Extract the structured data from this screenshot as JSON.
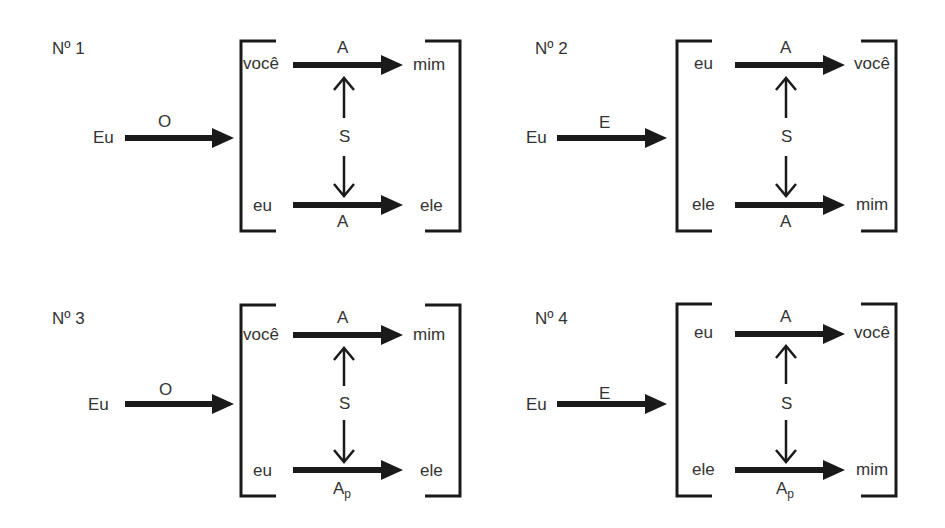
{
  "diagram": {
    "panels": [
      {
        "number": "Nº 1",
        "subject": "Eu",
        "input_label": "O",
        "top": {
          "left": "você",
          "label": "A",
          "label_sub": "",
          "right": "mim"
        },
        "middle": "S",
        "bottom": {
          "left": "eu",
          "label": "A",
          "label_sub": "",
          "right": "ele"
        }
      },
      {
        "number": "Nº 2",
        "subject": "Eu",
        "input_label": "E",
        "top": {
          "left": "eu",
          "label": "A",
          "label_sub": "",
          "right": "você"
        },
        "middle": "S",
        "bottom": {
          "left": "ele",
          "label": "A",
          "label_sub": "",
          "right": "mim"
        }
      },
      {
        "number": "Nº 3",
        "subject": "Eu",
        "input_label": "O",
        "top": {
          "left": "você",
          "label": "A",
          "label_sub": "",
          "right": "mim"
        },
        "middle": "S",
        "bottom": {
          "left": "eu",
          "label": "A",
          "label_sub": "p",
          "right": "ele"
        }
      },
      {
        "number": "Nº 4",
        "subject": "Eu",
        "input_label": "E",
        "top": {
          "left": "eu",
          "label": "A",
          "label_sub": "",
          "right": "você"
        },
        "middle": "S",
        "bottom": {
          "left": "ele",
          "label": "A",
          "label_sub": "p",
          "right": "mim"
        }
      }
    ],
    "colors": {
      "stroke": "#1a1a1a",
      "text": "#333333",
      "background": "#ffffff"
    }
  }
}
